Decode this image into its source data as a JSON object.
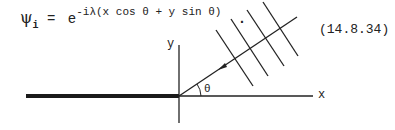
{
  "equation": {
    "lhs_symbol": "ψ",
    "lhs_subscript": "i",
    "equals": "=",
    "base": "e",
    "exponent": "-iλ(x cos θ + y sin θ)",
    "terminator": ".",
    "number": "(14.8.34)"
  },
  "figure": {
    "axis_labels": {
      "x": "x",
      "y": "y"
    },
    "angle_label": "θ",
    "wavefront_count": 4,
    "colors": {
      "ink": "#222222",
      "background": "#ffffff"
    }
  }
}
